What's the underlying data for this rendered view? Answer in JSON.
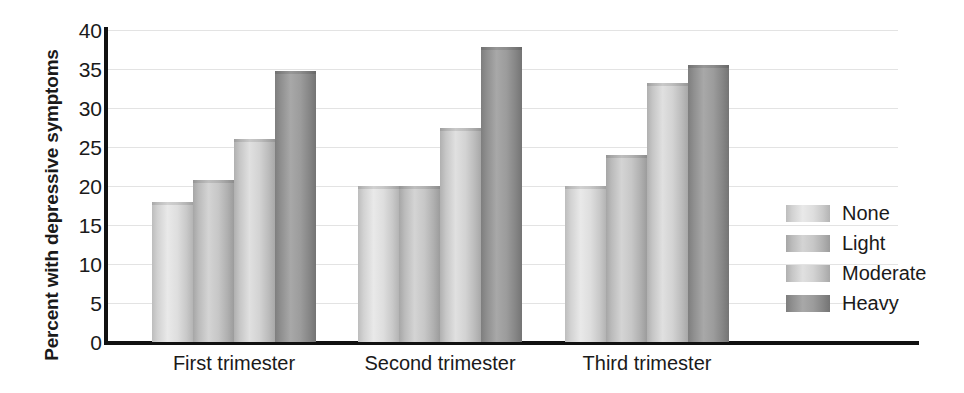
{
  "chart_data": {
    "type": "bar",
    "title": "",
    "subtitle": "",
    "xlabel": "",
    "ylabel": "Percent with depressive symptoms",
    "ylim": [
      0,
      40
    ],
    "yticks": [
      0,
      5,
      10,
      15,
      20,
      25,
      30,
      35,
      40
    ],
    "ytick_labels": [
      "0",
      "5",
      "10",
      "15",
      "20",
      "25",
      "30",
      "35",
      "40"
    ],
    "grid": true,
    "grid_axis": "y",
    "legend_position": "right",
    "categories": [
      "First trimester",
      "Second trimester",
      "Third trimester"
    ],
    "series": [
      {
        "name": "None",
        "values": [
          18.0,
          20.0,
          20.0
        ],
        "color": "#dedede"
      },
      {
        "name": "Light",
        "values": [
          20.8,
          20.0,
          24.0
        ],
        "color": "#c3c3c3"
      },
      {
        "name": "Moderate",
        "values": [
          26.0,
          27.5,
          33.2
        ],
        "color": "#d6d6d6"
      },
      {
        "name": "Heavy",
        "values": [
          34.8,
          37.8,
          35.5
        ],
        "color": "#8f8f8f"
      }
    ],
    "annotations": []
  },
  "legend": {
    "items": [
      {
        "label": "None"
      },
      {
        "label": "Light"
      },
      {
        "label": "Moderate"
      },
      {
        "label": "Heavy"
      }
    ]
  }
}
